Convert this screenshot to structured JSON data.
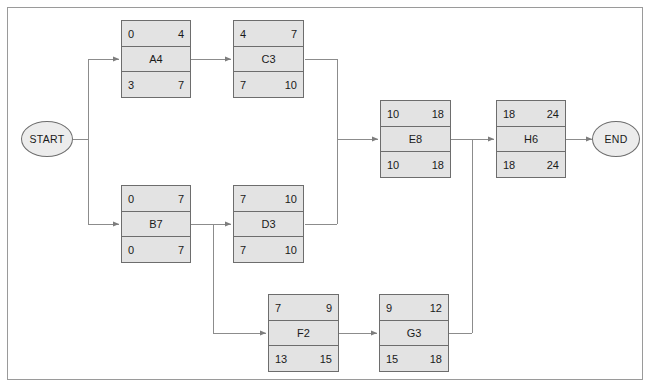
{
  "diagram": {
    "frame_color": "#9a9a9a",
    "node_fill": "#e3e3e3",
    "node_border": "#6d6d6d",
    "edge_color": "#8c8c8c",
    "background": "#ffffff"
  },
  "terminals": {
    "start": {
      "label": "START"
    },
    "end": {
      "label": "END"
    }
  },
  "nodes": [
    {
      "id": "A4",
      "label": "A4",
      "early_start": "0",
      "early_finish": "4",
      "late_start": "3",
      "late_finish": "7"
    },
    {
      "id": "C3",
      "label": "C3",
      "early_start": "4",
      "early_finish": "7",
      "late_start": "7",
      "late_finish": "10"
    },
    {
      "id": "B7",
      "label": "B7",
      "early_start": "0",
      "early_finish": "7",
      "late_start": "0",
      "late_finish": "7"
    },
    {
      "id": "D3",
      "label": "D3",
      "early_start": "7",
      "early_finish": "10",
      "late_start": "7",
      "late_finish": "10"
    },
    {
      "id": "E8",
      "label": "E8",
      "early_start": "10",
      "early_finish": "18",
      "late_start": "10",
      "late_finish": "18"
    },
    {
      "id": "H6",
      "label": "H6",
      "early_start": "18",
      "early_finish": "24",
      "late_start": "18",
      "late_finish": "24"
    },
    {
      "id": "F2",
      "label": "F2",
      "early_start": "7",
      "early_finish": "9",
      "late_start": "13",
      "late_finish": "15"
    },
    {
      "id": "G3",
      "label": "G3",
      "early_start": "9",
      "early_finish": "12",
      "late_start": "15",
      "late_finish": "18"
    }
  ],
  "edges": [
    {
      "from": "START",
      "to": "A4"
    },
    {
      "from": "START",
      "to": "B7"
    },
    {
      "from": "A4",
      "to": "C3"
    },
    {
      "from": "B7",
      "to": "D3"
    },
    {
      "from": "B7",
      "to": "F2"
    },
    {
      "from": "C3",
      "to": "E8"
    },
    {
      "from": "D3",
      "to": "E8"
    },
    {
      "from": "F2",
      "to": "G3"
    },
    {
      "from": "E8",
      "to": "H6"
    },
    {
      "from": "G3",
      "to": "H6"
    },
    {
      "from": "H6",
      "to": "END"
    }
  ]
}
